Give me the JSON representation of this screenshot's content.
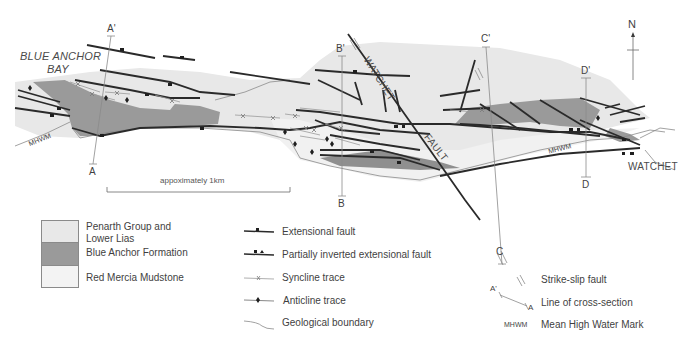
{
  "map": {
    "place_labels": {
      "blue_anchor_bay_line1": "BLUE ANCHOR",
      "blue_anchor_bay_line2": "BAY",
      "watchet_town": "WATCHET",
      "watchet_fault_1": "WATCHET",
      "watchet_fault_2": "FAULT"
    },
    "mhwm_labels": [
      "MHWM",
      "MHWM"
    ],
    "sections": [
      {
        "top": "A'",
        "bottom": "A"
      },
      {
        "top": "B'",
        "bottom": "B"
      },
      {
        "top": "C'",
        "bottom": "C"
      },
      {
        "top": "D'",
        "bottom": "D"
      }
    ],
    "north_arrow": "N",
    "scale_bar": "appoximately 1km"
  },
  "colors": {
    "penarth_lower_lias": "#e8e8e8",
    "blue_anchor_formation": "#9a9a9a",
    "red_mercia_mudstone": "#f3f3f3",
    "fault_line": "#2a2a2a",
    "thin_line": "#8a8a8a"
  },
  "legend": {
    "units": [
      {
        "label_line1": "Penarth Group and",
        "label_line2": "Lower Lias",
        "color": "#e8e8e8"
      },
      {
        "label_line1": "Blue Anchor Formation",
        "color": "#9a9a9a"
      },
      {
        "label_line1": "Red Mercia Mudstone",
        "color": "#f3f3f3"
      }
    ],
    "structures": [
      {
        "label": "Extensional fault",
        "icon": "extensional-fault-icon"
      },
      {
        "label": "Partially inverted extensional fault",
        "icon": "inverted-fault-icon"
      },
      {
        "label": "Syncline trace",
        "icon": "syncline-icon"
      },
      {
        "label": "Anticline trace",
        "icon": "anticline-icon"
      },
      {
        "label": "Geological boundary",
        "icon": "boundary-icon"
      }
    ],
    "other": [
      {
        "label": "Strike-slip fault",
        "icon": "strike-slip-icon"
      },
      {
        "label": "Line of cross-section",
        "icon": "cross-section-icon",
        "symbol_top": "A'",
        "symbol_bottom": "A"
      },
      {
        "label": "Mean High Water Mark",
        "icon": "mhwm-text",
        "symbol": "MHWM"
      }
    ]
  }
}
